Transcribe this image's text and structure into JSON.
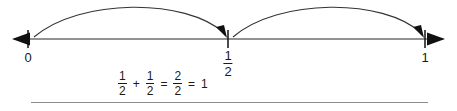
{
  "figure": {
    "name": "number-line-halves-addition",
    "line_color": "#6e6e6e",
    "ink_color": "#1a1a1a",
    "rule_color": "#8d8d8d"
  },
  "number_line": {
    "ticks": [
      {
        "value": "0",
        "kind": "integer",
        "x": 28
      },
      {
        "value": "1/2",
        "kind": "fraction",
        "numerator": "1",
        "denominator": "2",
        "x": 228
      },
      {
        "value": "1",
        "kind": "integer",
        "x": 425
      }
    ],
    "left_arrow": "left-arrowhead",
    "right_arrow": "right-arrowhead"
  },
  "jumps": [
    {
      "label": "jump-arc-zero-to-one-half",
      "from": "0",
      "to": "1/2"
    },
    {
      "label": "jump-arc-one-half-to-one",
      "from": "1/2",
      "to": "1"
    }
  ],
  "equation": {
    "term1": {
      "numerator": "1",
      "denominator": "2"
    },
    "plus": "+",
    "term2": {
      "numerator": "1",
      "denominator": "2"
    },
    "equals1": "=",
    "result_fraction": {
      "numerator": "2",
      "denominator": "2"
    },
    "equals2": "=",
    "result_whole": "1"
  }
}
